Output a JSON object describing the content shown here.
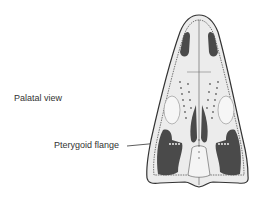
{
  "figure": {
    "view_label": "Palatal view",
    "annotations": [
      {
        "label": "Pterygoid flange"
      }
    ]
  },
  "colors": {
    "background": "#ffffff",
    "bone_fill": "#ececec",
    "outline": "#333333",
    "fenestra_dark": "#4a4a4a",
    "text": "#333333"
  }
}
